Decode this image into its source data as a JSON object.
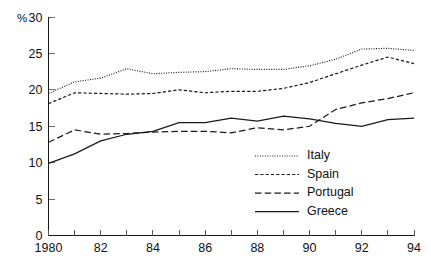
{
  "chart_data": {
    "type": "line",
    "title": "",
    "subtitle": "",
    "xlabel": "",
    "ylabel": "",
    "unit_label": "%",
    "x": [
      1980,
      1981,
      1982,
      1983,
      1984,
      1985,
      1986,
      1987,
      1988,
      1989,
      1990,
      1991,
      1992,
      1993,
      1994
    ],
    "x_tick_labels": [
      "1980",
      "",
      "82",
      "",
      "84",
      "",
      "86",
      "",
      "88",
      "",
      "90",
      "",
      "92",
      "",
      "94"
    ],
    "y_ticks": [
      0,
      5,
      10,
      15,
      20,
      25,
      30
    ],
    "y_tick_labels": [
      "0",
      "5",
      "10",
      "15",
      "20",
      "25",
      "30"
    ],
    "xlim": [
      1980,
      1994
    ],
    "ylim": [
      0,
      30
    ],
    "grid": false,
    "legend_position": "center-right-inside",
    "series": [
      {
        "name": "Italy",
        "style": "dotted",
        "color": "#1a1a1a",
        "values": [
          19.5,
          21.1,
          21.6,
          22.9,
          22.2,
          22.4,
          22.5,
          22.9,
          22.8,
          22.8,
          23.3,
          24.2,
          25.6,
          25.7,
          25.4
        ]
      },
      {
        "name": "Spain",
        "style": "dashed-fine",
        "color": "#1a1a1a",
        "values": [
          18.1,
          19.6,
          19.5,
          19.4,
          19.5,
          20.0,
          19.6,
          19.8,
          19.8,
          20.2,
          21.0,
          22.2,
          23.4,
          24.5,
          23.6
        ]
      },
      {
        "name": "Portugal",
        "style": "dashed-long",
        "color": "#1a1a1a",
        "values": [
          12.8,
          14.5,
          13.9,
          14.0,
          14.2,
          14.3,
          14.3,
          14.1,
          14.8,
          14.5,
          15.0,
          17.3,
          18.2,
          18.8,
          19.6
        ]
      },
      {
        "name": "Greece",
        "style": "solid",
        "color": "#1a1a1a",
        "values": [
          9.9,
          11.2,
          13.0,
          13.9,
          14.3,
          15.5,
          15.5,
          16.1,
          15.7,
          16.4,
          16.0,
          15.4,
          15.0,
          15.9,
          16.1
        ]
      }
    ]
  },
  "legend": {
    "entries": [
      {
        "label": "Italy"
      },
      {
        "label": "Spain"
      },
      {
        "label": "Portugal"
      },
      {
        "label": "Greece"
      }
    ]
  }
}
